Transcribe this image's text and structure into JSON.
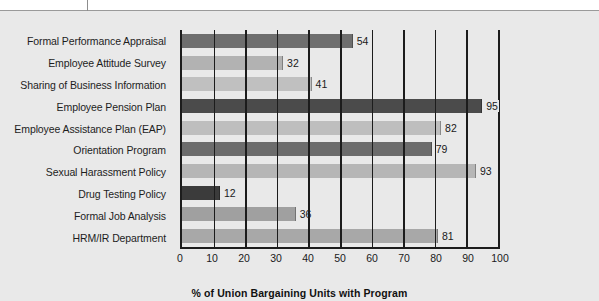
{
  "chart_data": {
    "type": "bar",
    "orientation": "horizontal",
    "title": "",
    "xlabel": "% of Union Bargaining Units with Program",
    "ylabel": "",
    "xlim": [
      0,
      100
    ],
    "xticks": [
      0,
      10,
      20,
      30,
      40,
      50,
      60,
      70,
      80,
      90,
      100
    ],
    "grid": true,
    "grid_axis": "x",
    "legend": "none",
    "categories": [
      "Formal Performance Appraisal",
      "Employee Attitude Survey",
      "Sharing of Business Information",
      "Employee Pension Plan",
      "Employee Assistance Plan (EAP)",
      "Orientation Program",
      "Sexual Harassment Policy",
      "Drug Testing Policy",
      "Formal Job Analysis",
      "HRM/IR Department"
    ],
    "values": [
      54,
      32,
      41,
      95,
      82,
      79,
      93,
      12,
      36,
      81
    ],
    "bar_colors": [
      "#6e6e6e",
      "#b2b2b2",
      "#c0c0c0",
      "#4b4b4b",
      "#bebebe",
      "#6c6c6c",
      "#b6b6b6",
      "#3b3b3b",
      "#a0a0a0",
      "#a8a8a8"
    ],
    "data_labels": [
      "54",
      "32",
      "41",
      "95",
      "82",
      "79",
      "93",
      "12",
      "36",
      "81"
    ]
  },
  "axis": {
    "x_tick_labels": [
      "0",
      "10",
      "20",
      "30",
      "40",
      "50",
      "60",
      "70",
      "80",
      "90",
      "100"
    ],
    "x_title": "% of Union Bargaining Units with Program"
  },
  "style": {
    "page_background": "#ffffff",
    "plot_background": "#e9e9e9",
    "axis_color": "#1c1c1c",
    "text_color": "#1a1a1a"
  }
}
